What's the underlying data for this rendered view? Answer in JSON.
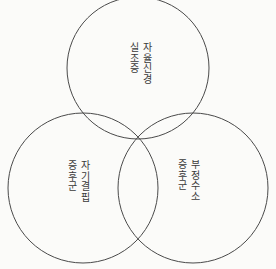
{
  "figure": {
    "type": "venn-diagram",
    "set_count": 3,
    "background_color": "#fbfbf9",
    "stroke_color": "#4a4a4a",
    "text_color": "#3a3a3a",
    "writing_mode": "vertical-right-to-left"
  },
  "circles": {
    "top": {
      "cx": 138,
      "cy": 68,
      "r": 71
    },
    "left": {
      "cx": 83,
      "cy": 188,
      "r": 75
    },
    "right": {
      "cx": 193,
      "cy": 188,
      "r": 75
    }
  },
  "labels": {
    "top": {
      "primary": "자율신경",
      "secondary": "실조증",
      "full": "자율신경실조증"
    },
    "left": {
      "primary": "자기결핍",
      "secondary": "증후군",
      "full": "자기결핍증후군"
    },
    "right": {
      "primary": "부정수소",
      "secondary": "증후군",
      "full": "부정수소증후군"
    }
  }
}
